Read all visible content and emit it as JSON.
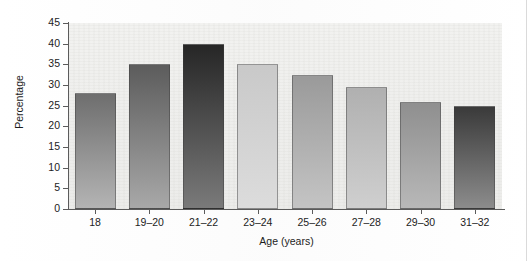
{
  "chart_data": {
    "type": "bar",
    "title": "",
    "subtitle": "",
    "xlabel": "Age (years)",
    "ylabel": "Percentage",
    "categories": [
      "18",
      "19–20",
      "21–22",
      "23–24",
      "25–26",
      "27–28",
      "29–30",
      "31–32"
    ],
    "values": [
      28,
      35,
      40,
      35,
      32.5,
      29.5,
      26,
      25
    ],
    "ylim": [
      0,
      45
    ],
    "yticks": [
      0,
      5,
      10,
      15,
      20,
      25,
      30,
      35,
      40,
      45
    ],
    "ytick_labels": [
      "0",
      "5",
      "10",
      "15",
      "20",
      "25",
      "30",
      "35",
      "40",
      "45"
    ],
    "grid": false,
    "legend": null,
    "legend_position": "none",
    "annotations": [],
    "bar_colors": [
      "#6e6e6e",
      "#5c5c5c",
      "#262626",
      "#c9c9c9",
      "#9a9a9a",
      "#b0b0b0",
      "#8f8f8f",
      "#3a3a3a"
    ],
    "bar_colors_bottom": [
      "#b4b4b4",
      "#a8a8a8",
      "#7a7a7a",
      "#dcdcdc",
      "#c4c4c4",
      "#cfcfcf",
      "#b8b8b8",
      "#8c8c8c"
    ]
  }
}
